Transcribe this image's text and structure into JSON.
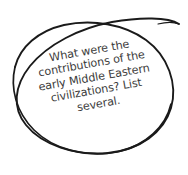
{
  "canvas": {
    "width": 188,
    "height": 175,
    "background_color": "#ffffff"
  },
  "annotation": {
    "shape": "hand-drawn-ellipse-double-loop",
    "stroke_color": "#1a1a1a",
    "fill": "none",
    "rotation_degrees": -12
  },
  "note": {
    "text_color": "#3c3c3c",
    "rotation_degrees": -10,
    "full_text": "What were the contributions of the early Middle Eastern civilizations? List several.",
    "lines": [
      "What were the",
      "contributions of the",
      "early Middle Eastern",
      "civilizations? List",
      "several."
    ]
  }
}
